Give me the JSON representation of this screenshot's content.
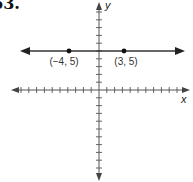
{
  "problem": {
    "number": "63."
  },
  "chart_data": {
    "type": "line",
    "title": "",
    "xlabel": "x",
    "ylabel": "y",
    "xlim": [
      -11,
      11
    ],
    "ylim": [
      -11,
      11
    ],
    "grid": false,
    "tick_interval": 1,
    "ticks_labeled": false,
    "series": [
      {
        "name": "horizontal line y = 5",
        "kind": "line",
        "equation": "y = 5",
        "arrows": "both",
        "points": [
          {
            "x": -4,
            "y": 5,
            "label": "(−4, 5)"
          },
          {
            "x": 3,
            "y": 5,
            "label": "(3, 5)"
          }
        ]
      }
    ]
  },
  "labels": {
    "x_axis": "x",
    "y_axis": "y",
    "point1": "(−4, 5)",
    "point2": "(3, 5)"
  },
  "colors": {
    "axis": "#555555",
    "line": "#333333",
    "point": "#111111"
  }
}
